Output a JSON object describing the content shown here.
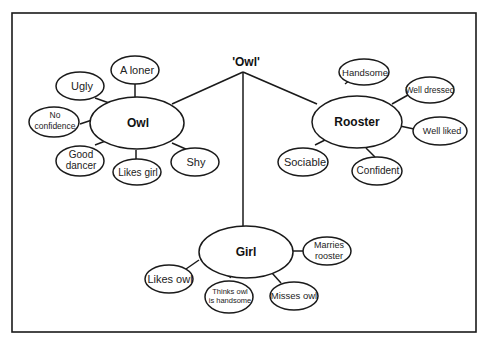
{
  "title": "'Owl'",
  "hubs": {
    "owl": {
      "label": "Owl"
    },
    "rooster": {
      "label": "Rooster"
    },
    "girl": {
      "label": "Girl"
    }
  },
  "owl_traits": [
    "Ugly",
    "A loner",
    "No",
    "confidence",
    "Good",
    "dancer",
    "Likes girl",
    "Shy"
  ],
  "rooster_traits": [
    "Handsome",
    "Well dressed",
    "Well liked",
    "Sociable",
    "Confident"
  ],
  "girl_traits": [
    "Likes owl",
    "Thinks owl",
    "is handsome",
    "Misses owl",
    "Marries",
    "rooster"
  ]
}
